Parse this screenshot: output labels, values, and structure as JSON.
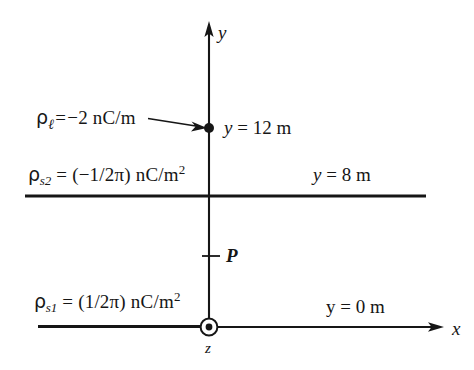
{
  "figure": {
    "kind": "physics-coordinate-diagram",
    "background_color": "#ffffff",
    "line_color": "#161616"
  },
  "axes": {
    "y_axis": {
      "label": "y",
      "arrow": "up"
    },
    "x_axis": {
      "label": "x",
      "arrow": "right"
    },
    "z_axis": {
      "label": "z",
      "marker": "dot-in-circle-out-of-page"
    }
  },
  "point": {
    "label": "P",
    "tick": "left-tick-mark"
  },
  "line_charge": {
    "symbol_rho": "ρ",
    "subscript": "ℓ",
    "equals": "=",
    "value": "−2 nC/m",
    "full_text": "ρℓ = −2 nC/m",
    "position_label_var": "y",
    "position_label_eq": "=",
    "position_label_value": "12 m",
    "position_label_full": "y = 12 m",
    "marker": "filled-dot",
    "annotation_arrow": "points-right-to-dot"
  },
  "sheet_upper": {
    "symbol_rho": "ρ",
    "subscript": "s2",
    "equals": "=",
    "value": "(−1/2π) nC/m",
    "exponent": "2",
    "full_text": "ρs2 = (−1/2π) nC/m²",
    "position_label_var": "y",
    "position_label_eq": "=",
    "position_label_value": "8 m",
    "position_label_full": "y = 8 m"
  },
  "sheet_lower": {
    "symbol_rho": "ρ",
    "subscript": "s1",
    "equals": "=",
    "value": "(1/2π) nC/m",
    "exponent": "2",
    "full_text": "ρs1 = (1/2π) nC/m²",
    "position_label_var": "y",
    "position_label_eq": "=",
    "position_label_value": "0 m",
    "position_label_full": "y = 0 m"
  }
}
